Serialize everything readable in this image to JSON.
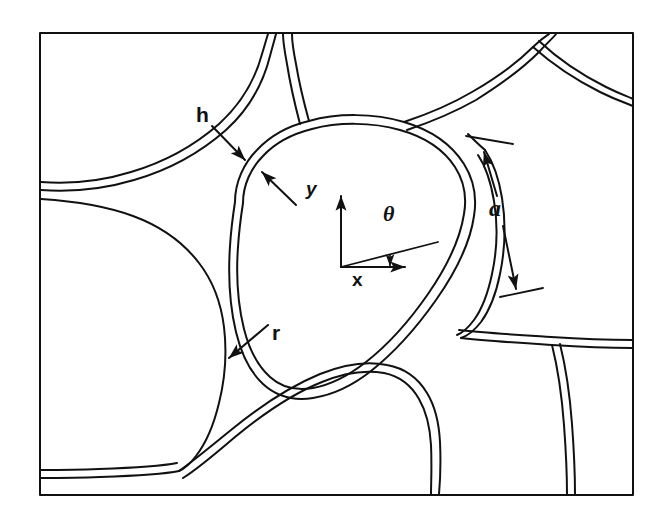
{
  "figure": {
    "kind": "technical-line-diagram",
    "background_color": "#ffffff",
    "line_color": "#111111",
    "frame": {
      "name": "figure-border",
      "x": 40,
      "y": 33,
      "width": 593,
      "height": 462,
      "stroke_width": 2
    },
    "annotations": [
      {
        "id": "h",
        "label": "h",
        "meaning": "cell wall thickness",
        "label_x": 196,
        "label_y": 115,
        "style": "bold-sans"
      },
      {
        "id": "a",
        "label": "a",
        "meaning": "cell edge length",
        "label_x": 489,
        "label_y": 209,
        "style": "bold-italic-serif"
      },
      {
        "id": "r",
        "label": "r",
        "meaning": "Plateau border fillet radius",
        "label_x": 272,
        "label_y": 333,
        "style": "bold-sans"
      },
      {
        "id": "theta",
        "label": "θ",
        "meaning": "orientation angle of cell edge from x-axis",
        "label_x": 383,
        "label_y": 215,
        "style": "bold-italic-serif"
      }
    ],
    "axes": {
      "name": "coordinate-system",
      "origin_x": 341,
      "origin_y": 267,
      "x_label": "x",
      "y_label": "y",
      "angle_label": "θ",
      "x_label_pos": {
        "x": 352,
        "y": 270
      },
      "y_label_pos": {
        "x": 306,
        "y": 190
      },
      "x_axis_end": {
        "x": 410,
        "y": 267
      },
      "y_axis_end": {
        "x": 341,
        "y": 192
      },
      "theta_ray_end": {
        "x": 438,
        "y": 243
      }
    }
  }
}
